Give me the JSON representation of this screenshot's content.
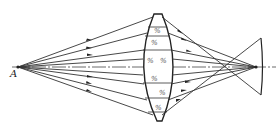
{
  "figure": {
    "type": "optical-ray-diagram",
    "source_label": "A",
    "lens_hatch_mark": "%",
    "colors": {
      "line": "#222222",
      "background": "#ffffff"
    }
  }
}
